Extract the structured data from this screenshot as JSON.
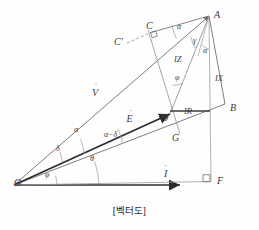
{
  "figure": {
    "caption": "[벡터도]",
    "stroke_color": "#6e6e6e",
    "bold_stroke_color": "#2b2b2b",
    "text_color": "#3a3a3a",
    "background": "#fefefe"
  },
  "points": [
    {
      "id": "O",
      "label": "O",
      "x": 14,
      "y": 185
    },
    {
      "id": "A",
      "label": "A",
      "x": 214,
      "y": 17
    },
    {
      "id": "B",
      "label": "B",
      "x": 230,
      "y": 110
    },
    {
      "id": "C",
      "label": "C",
      "x": 146,
      "y": 30
    },
    {
      "id": "Cp",
      "label": "C'",
      "x": 116,
      "y": 44
    },
    {
      "id": "D",
      "label": "D",
      "x": 164,
      "y": 119
    },
    {
      "id": "G",
      "label": "G",
      "x": 174,
      "y": 140
    },
    {
      "id": "F",
      "label": "F",
      "x": 216,
      "y": 185
    }
  ],
  "vectors": [
    {
      "id": "V",
      "label": "V",
      "dot": "˙",
      "x": 94,
      "y": 86
    },
    {
      "id": "E",
      "label": "E",
      "dot": "˙",
      "x": 120,
      "y": 112
    },
    {
      "id": "I",
      "label": "I",
      "dot": "˙",
      "x": 148,
      "y": 167
    }
  ],
  "angles": [
    {
      "id": "alpha-O",
      "label": "α",
      "x": 74,
      "y": 129
    },
    {
      "id": "delta-O",
      "label": "δ",
      "x": 56,
      "y": 148
    },
    {
      "id": "theta-O",
      "label": "θ",
      "x": 90,
      "y": 159
    },
    {
      "id": "phi-O",
      "label": "φ",
      "x": 45,
      "y": 175
    },
    {
      "id": "alpha-minus-delta",
      "label": "α−δ",
      "x": 105,
      "y": 135
    },
    {
      "id": "alpha-C",
      "label": "α",
      "x": 178,
      "y": 36
    },
    {
      "id": "gamma-A",
      "label": "γ",
      "x": 195,
      "y": 45
    },
    {
      "id": "alpha-A",
      "label": "α",
      "x": 205,
      "y": 54
    },
    {
      "id": "phi-D",
      "label": "φ",
      "x": 177,
      "y": 78
    }
  ],
  "segments": [
    {
      "id": "IZ",
      "label": "IZ",
      "x": 176,
      "y": 60
    },
    {
      "id": "IX",
      "label": "IX",
      "x": 217,
      "y": 79
    },
    {
      "id": "IR",
      "label": "IR",
      "x": 186,
      "y": 112
    }
  ],
  "geometry": {
    "O": [
      14,
      185
    ],
    "A": [
      209,
      16
    ],
    "B": [
      225,
      104
    ],
    "C": [
      151,
      32
    ],
    "Cp": [
      127,
      43
    ],
    "D": [
      170,
      114
    ],
    "G": [
      180,
      134
    ],
    "F": [
      211,
      181
    ],
    "Imark": [
      167,
      182
    ]
  }
}
